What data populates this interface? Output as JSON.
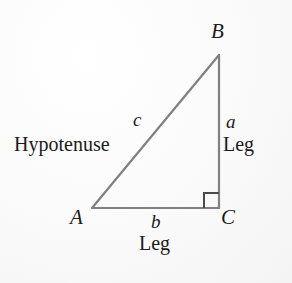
{
  "figure": {
    "background_color": "#fbfbfb",
    "line_color": "#808080",
    "text_color": "#1b1b1b",
    "vertices": [
      {
        "name": "A",
        "label": "A",
        "x": 92,
        "y": 208
      },
      {
        "name": "B",
        "label": "B",
        "x": 219,
        "y": 55
      },
      {
        "name": "C",
        "label": "C",
        "x": 219,
        "y": 208
      }
    ],
    "sides": [
      {
        "name": "hypotenuse",
        "label": "c",
        "word": "Hypotenuse",
        "from": "A",
        "to": "B"
      },
      {
        "name": "vertical-leg",
        "label": "a",
        "word": "Leg",
        "from": "B",
        "to": "C"
      },
      {
        "name": "horizontal-leg",
        "label": "b",
        "word": "Leg",
        "from": "A",
        "to": "C"
      }
    ],
    "right_angle": {
      "at_vertex": "C",
      "marker": "square",
      "size": 15
    }
  },
  "labels": {
    "vertex_a": "A",
    "vertex_b": "B",
    "vertex_c": "C",
    "side_a": "a",
    "side_b": "b",
    "side_c": "c",
    "hypotenuse_word": "Hypotenuse",
    "leg_word_right": "Leg",
    "leg_word_bottom": "Leg"
  }
}
